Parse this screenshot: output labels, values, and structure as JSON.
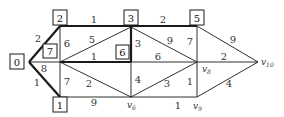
{
  "diagram": {
    "type": "weighted-graph",
    "nodes": [
      {
        "id": "n0",
        "label": "0",
        "boxed": true
      },
      {
        "id": "n2",
        "label": "2",
        "boxed": true
      },
      {
        "id": "n7",
        "label": "7",
        "boxed": true
      },
      {
        "id": "n1",
        "label": "1",
        "boxed": true
      },
      {
        "id": "n3",
        "label": "3",
        "boxed": true
      },
      {
        "id": "n6",
        "label": "6",
        "boxed": true
      },
      {
        "id": "n5",
        "label": "5",
        "boxed": true
      },
      {
        "id": "v6",
        "label": "v6",
        "boxed": false
      },
      {
        "id": "v8",
        "label": "v8",
        "boxed": false
      },
      {
        "id": "v9",
        "label": "v9",
        "boxed": false
      },
      {
        "id": "v10",
        "label": "v10",
        "boxed": false
      }
    ],
    "edge_weights": {
      "e_0_2": "2",
      "e_0_7": "8",
      "e_0_1": "1",
      "e_2_3": "1",
      "e_2_7": "6",
      "e_7_3": "5",
      "e_7_6": "1",
      "e_7_1": "7",
      "e_7_v6": "2",
      "e_1_v6": "9",
      "e_3_5": "2",
      "e_3_6": "3",
      "e_3_v8": "9",
      "e_6_v8": "6",
      "e_6_v6": "4",
      "e_v6_v8": "3",
      "e_5_v8": "7",
      "e_v8_v9": "1",
      "e_v6_v9": "1",
      "e_5_v10": "9",
      "e_v8_v10": "2",
      "e_v9_v10": "4"
    },
    "vertex_labels": {
      "v6": "v",
      "v6_sub": "6",
      "v8": "v",
      "v8_sub": "8",
      "v9": "v",
      "v9_sub": "9",
      "v10": "v",
      "v10_sub": "10"
    }
  }
}
